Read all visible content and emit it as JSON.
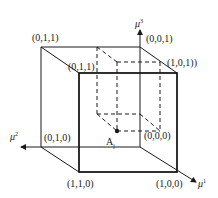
{
  "diagram": {
    "type": "unit-cube-coordinate-diagram",
    "axes": [
      {
        "id": "mu1",
        "base": "μ",
        "superscript": "1",
        "direction": "down-right"
      },
      {
        "id": "mu2",
        "base": "μ",
        "superscript": "2",
        "direction": "left"
      },
      {
        "id": "mu3",
        "base": "μ",
        "superscript": "3",
        "direction": "up"
      }
    ],
    "vertex_labels": {
      "back_top_left": "(0,1,1)",
      "inner_top_left": "(0,1,1)",
      "top_origin": "(0,0,1)",
      "front_top_right": "(1,0,1))",
      "back_bottom_left": "(0,1,0)",
      "origin": "(0,0,0)",
      "front_bottom_left": "(1,1,0)",
      "front_bottom_right": "(1,0,0)"
    },
    "point": {
      "label_base": "A",
      "label_sub": "j"
    },
    "colors": {
      "line": "#1a1a1a",
      "background": "#ffffff"
    }
  }
}
